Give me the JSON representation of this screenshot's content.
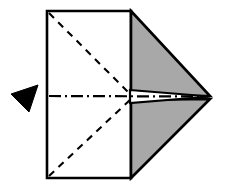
{
  "diagram": {
    "title": "Paper folding step diagram",
    "canvas": {
      "width": 225,
      "height": 187,
      "background": "#ffffff"
    },
    "colors": {
      "stroke": "#000000",
      "paper_face": "#ffffff",
      "shaded_face": "#a8a8a8",
      "arrow": "#000000",
      "wedge_highlight": "#ffffff"
    },
    "line_styles": {
      "edge": "solid",
      "mountain_valley_crease": "dashed",
      "center_axis": "dash-dot"
    },
    "shapes": [
      {
        "id": "paper-rectangle",
        "name": "paper-rectangle",
        "kind": "rectangle",
        "fill": "#ffffff",
        "stroke": "#000000",
        "stroke_width": 2.6,
        "points": "47,11 131,11 131,178 47,178"
      },
      {
        "id": "upper-shaded-flap",
        "name": "upper-shaded-flap",
        "kind": "triangle",
        "fill": "#a8a8a8",
        "stroke": "#000000",
        "stroke_width": 2.6,
        "points": "131,11 210,96 131,96"
      },
      {
        "id": "lower-shaded-flap",
        "name": "lower-shaded-flap",
        "kind": "triangle",
        "fill": "#a8a8a8",
        "stroke": "#000000",
        "stroke_width": 2.6,
        "points": "131,100 210,99 131,178"
      },
      {
        "id": "center-wedge-highlight",
        "name": "center-wedge-highlight",
        "kind": "wedge",
        "fill": "#ffffff",
        "stroke": "#000000",
        "stroke_width": 2.2,
        "points": "130,90 210,96.5 130,103"
      }
    ],
    "creases": [
      {
        "id": "upper-diagonal-crease",
        "name": "upper-diagonal-crease",
        "style": "dashed",
        "from": "49,13",
        "to": "131,95",
        "dash": "7,6",
        "stroke_width": 2.1
      },
      {
        "id": "lower-diagonal-crease",
        "name": "lower-diagonal-crease",
        "style": "dashed",
        "from": "49,176",
        "to": "131,99",
        "dash": "7,6",
        "stroke_width": 2.1
      },
      {
        "id": "horizontal-center-axis",
        "name": "horizontal-center-axis",
        "style": "dash-dot",
        "from": "49,96",
        "to": "208,96.5",
        "dash": "12,4,2,4",
        "stroke_width": 2.2
      }
    ],
    "arrow": {
      "id": "fold-direction-arrow",
      "name": "fold-direction-arrow",
      "fill": "#000000",
      "points": "11,94 38,85 29,112",
      "direction": "left"
    }
  }
}
